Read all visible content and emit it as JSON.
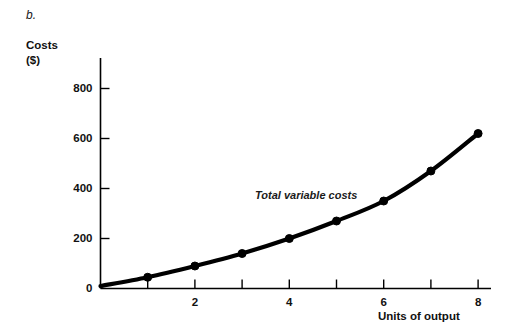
{
  "figure": {
    "panel_label": "b.",
    "series_annotation": "Total variable costs"
  },
  "chart_data": {
    "type": "line",
    "title": "",
    "subtitle": "",
    "xlabel": "Units of output",
    "ylabel": "Costs\n($)",
    "ylabel_lines": [
      "Costs",
      "($)"
    ],
    "x": [
      1,
      2,
      3,
      4,
      5,
      6,
      7,
      8
    ],
    "values": [
      45,
      90,
      140,
      200,
      270,
      350,
      470,
      620
    ],
    "series": [
      {
        "name": "Total variable costs",
        "x": [
          1,
          2,
          3,
          4,
          5,
          6,
          7,
          8
        ],
        "values": [
          45,
          90,
          140,
          200,
          270,
          350,
          470,
          620
        ]
      }
    ],
    "xlim": [
      0,
      8.5
    ],
    "ylim": [
      0,
      900
    ],
    "xticks": [
      1,
      2,
      3,
      4,
      5,
      6,
      7,
      8
    ],
    "xtick_labels": [
      "",
      "2",
      "",
      "4",
      "",
      "6",
      "",
      "8"
    ],
    "yticks": [
      0,
      200,
      400,
      600,
      800
    ],
    "ytick_labels": [
      "0",
      "200",
      "400",
      "600",
      "800"
    ],
    "grid": false,
    "legend": false,
    "markers": "filled-circle",
    "line_color": "#000000",
    "axis_color": "#000000",
    "background_color": "#ffffff"
  }
}
